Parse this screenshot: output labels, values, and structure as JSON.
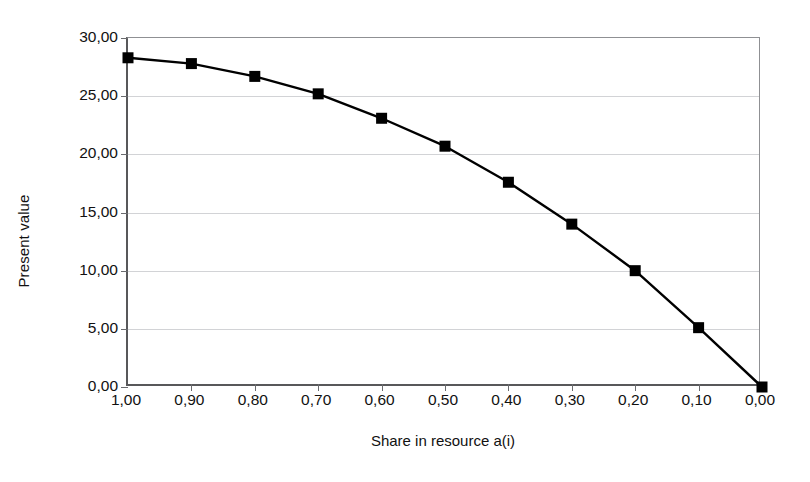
{
  "chart_data": {
    "type": "line",
    "title": "",
    "subtitle": "",
    "xlabel": "Share in resource a(i)",
    "ylabel": "Present value",
    "x": [
      1.0,
      0.9,
      0.8,
      0.7,
      0.6,
      0.5,
      0.4,
      0.3,
      0.2,
      0.1,
      0.0
    ],
    "xtick_labels": [
      "1,00",
      "0,90",
      "0,80",
      "0,70",
      "0,60",
      "0,50",
      "0,40",
      "0,30",
      "0,20",
      "0,10",
      "0,00"
    ],
    "ytick_labels": [
      "30,00",
      "25,00",
      "20,00",
      "15,00",
      "10,00",
      "5,00",
      "0,00"
    ],
    "ytick_values": [
      30,
      25,
      20,
      15,
      10,
      5,
      0
    ],
    "xlim": [
      1.0,
      0.0
    ],
    "ylim": [
      0,
      30
    ],
    "x_axis_direction": "descending",
    "grid": "horizontal",
    "legend": "none",
    "series": [
      {
        "name": "Present value",
        "marker": "square",
        "marker_color": "#000000",
        "line_color": "#000000",
        "values": [
          28.3,
          27.8,
          26.7,
          25.2,
          23.1,
          20.7,
          17.6,
          14.0,
          10.0,
          5.1,
          0.0
        ]
      }
    ],
    "colors": {
      "line": "#000000",
      "marker": "#000000",
      "gridline": "#d2d3d6",
      "axis": "#58585a",
      "frame": "#8f9093",
      "background": "#ffffff",
      "text": "#111111"
    }
  }
}
